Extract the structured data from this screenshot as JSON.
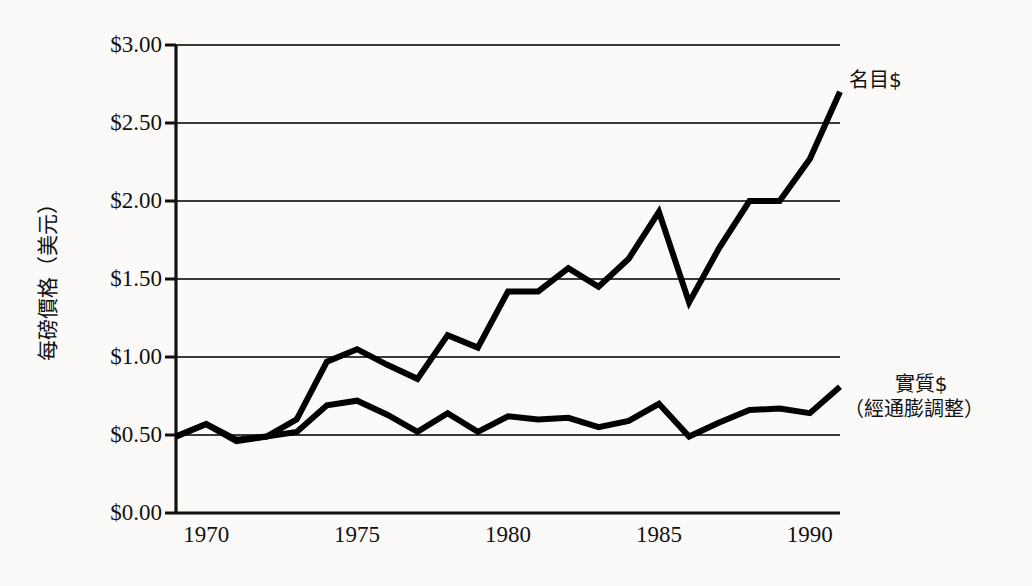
{
  "chart_data": {
    "type": "line",
    "title": "",
    "xlabel": "",
    "ylabel": "每磅價格（美元）",
    "xlim": [
      1969,
      1991
    ],
    "ylim": [
      0,
      3.0
    ],
    "grid": true,
    "y_tick_labels": [
      "$3.00",
      "$2.50",
      "$2.00",
      "$1.50",
      "$1.00",
      "$0.50",
      "$0.00"
    ],
    "y_tick_values": [
      3.0,
      2.5,
      2.0,
      1.5,
      1.0,
      0.5,
      0.0
    ],
    "x_tick_labels": [
      "1970",
      "1975",
      "1980",
      "1985",
      "1990"
    ],
    "x_tick_values": [
      1970,
      1975,
      1980,
      1985,
      1990
    ],
    "x": [
      1969,
      1970,
      1971,
      1972,
      1973,
      1974,
      1975,
      1976,
      1977,
      1978,
      1979,
      1980,
      1981,
      1982,
      1983,
      1984,
      1985,
      1986,
      1987,
      1988,
      1989,
      1990,
      1991
    ],
    "series": [
      {
        "name": "名目$",
        "values": [
          0.49,
          0.57,
          0.46,
          0.49,
          0.6,
          0.97,
          1.05,
          0.95,
          0.86,
          1.14,
          1.06,
          1.42,
          1.42,
          1.57,
          1.45,
          1.63,
          1.93,
          1.35,
          1.7,
          2.0,
          2.0,
          2.27,
          2.7
        ]
      },
      {
        "name": "實質$（經通膨調整）",
        "values": [
          0.49,
          0.57,
          0.47,
          0.49,
          0.52,
          0.69,
          0.72,
          0.63,
          0.52,
          0.64,
          0.52,
          0.62,
          0.6,
          0.61,
          0.55,
          0.59,
          0.7,
          0.49,
          0.58,
          0.66,
          0.67,
          0.64,
          0.81
        ]
      }
    ],
    "annotations": [
      {
        "id": "nominal",
        "text": "名目$",
        "near_year": 1991,
        "near_value": 2.7
      },
      {
        "id": "real_line1",
        "text": "實質$",
        "near_year": 1991,
        "near_value": 0.81
      },
      {
        "id": "real_line2",
        "text": "（經通膨調整）",
        "near_year": 1991,
        "near_value": 0.81
      }
    ],
    "colors": {
      "line": "#000000",
      "grid": "#3a3a3a",
      "axis": "#111111",
      "background": "#fbfaf8"
    }
  },
  "axis": {
    "y_title": "每磅價格（美元）",
    "y_ticks": [
      "$3.00",
      "$2.50",
      "$2.00",
      "$1.50",
      "$1.00",
      "$0.50",
      "$0.00"
    ],
    "x_ticks": [
      "1970",
      "1975",
      "1980",
      "1985",
      "1990"
    ]
  },
  "labels": {
    "nominal": "名目$",
    "real_main": "實質$",
    "real_sub": "（經通膨調整）"
  }
}
